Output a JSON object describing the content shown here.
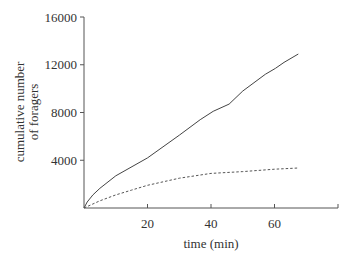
{
  "chart_data": {
    "type": "line",
    "title": "",
    "xlabel": "time (min)",
    "ylabel": "cumulative number of foragers",
    "ylabel_lines": [
      "cumulative number",
      "of foragers"
    ],
    "xlim": [
      0,
      80
    ],
    "ylim": [
      0,
      16000
    ],
    "x_ticks": [
      20,
      40,
      60
    ],
    "x_tick_marks": [
      20,
      40,
      60,
      80
    ],
    "y_ticks": [
      4000,
      8000,
      12000,
      16000
    ],
    "grid": false,
    "legend": null,
    "series": [
      {
        "name": "solid",
        "style": "solid",
        "x": [
          0,
          1,
          2.8,
          5,
          10,
          20,
          30,
          36.6,
          40.7,
          45.7,
          50,
          57.1,
          60.3,
          63,
          67.5
        ],
        "y": [
          0,
          500,
          1100,
          1650,
          2700,
          4200,
          6100,
          7400,
          8100,
          8700,
          9800,
          11200,
          11700,
          12200,
          12900
        ]
      },
      {
        "name": "dashed",
        "style": "dashed",
        "x": [
          0,
          5,
          10,
          15,
          20,
          30,
          40,
          50,
          60,
          67.5
        ],
        "y": [
          0,
          600,
          1100,
          1500,
          1900,
          2500,
          2900,
          3050,
          3250,
          3350
        ]
      }
    ]
  }
}
